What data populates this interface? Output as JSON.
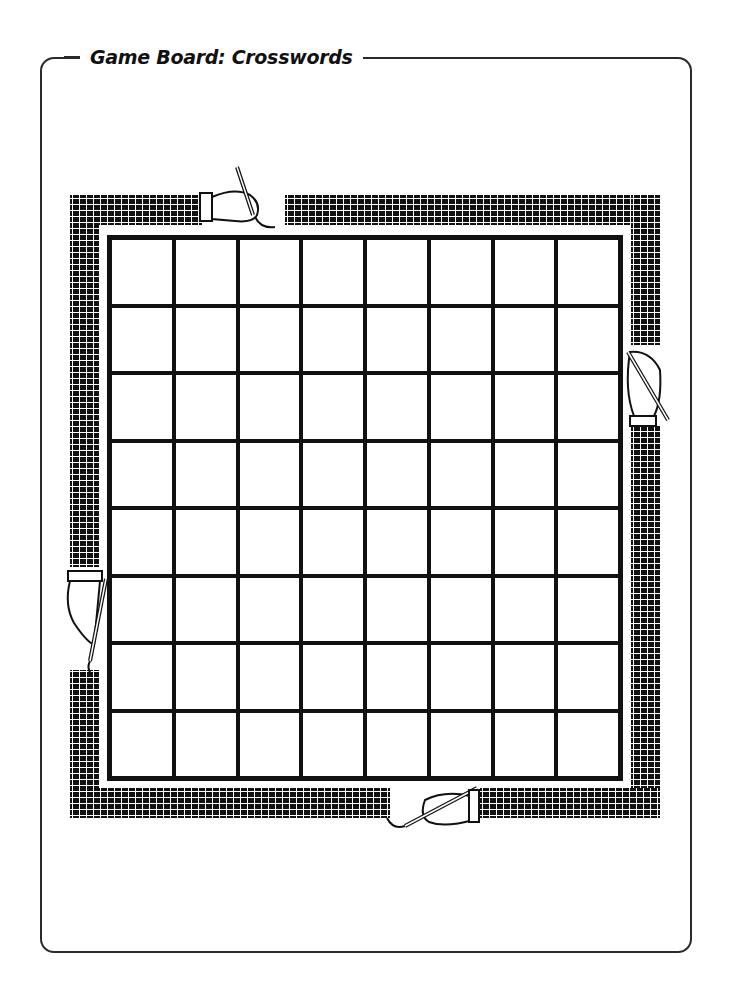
{
  "header": {
    "title": "Game Board: Crosswords"
  },
  "board": {
    "type": "crossword-grid",
    "rows": 8,
    "cols": 8,
    "cells_filled": 0,
    "border_style": "woven-pattern",
    "decorations": [
      "hand-with-pencil-top",
      "hand-with-pencil-right",
      "hand-with-pencil-left",
      "hand-with-pencil-bottom"
    ]
  },
  "colors": {
    "ink": "#111111",
    "background": "#ffffff",
    "frame": "#2a2a2a"
  }
}
